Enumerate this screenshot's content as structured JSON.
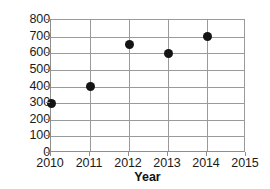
{
  "chart_data": {
    "type": "scatter",
    "title": "",
    "xlabel": "Year",
    "ylabel": "",
    "x": [
      2010,
      2011,
      2012,
      2013,
      2014
    ],
    "values": [
      300,
      400,
      650,
      600,
      700
    ],
    "points": [
      {
        "x": 2010,
        "y": 300
      },
      {
        "x": 2011,
        "y": 400
      },
      {
        "x": 2012,
        "y": 650
      },
      {
        "x": 2013,
        "y": 600
      },
      {
        "x": 2014,
        "y": 700
      }
    ],
    "xlim": [
      2010,
      2015
    ],
    "ylim": [
      0,
      800
    ],
    "x_ticks": [
      "2010",
      "2011",
      "2012",
      "2013",
      "2014",
      "2015"
    ],
    "y_ticks": [
      "0",
      "100",
      "200",
      "300",
      "400",
      "500",
      "600",
      "700",
      "800"
    ],
    "grid": true,
    "legend": null,
    "marker_color": "#141414",
    "grid_color": "#9a9a9a",
    "axis_color": "#8e8e8e",
    "background_color": "#ffffff"
  }
}
